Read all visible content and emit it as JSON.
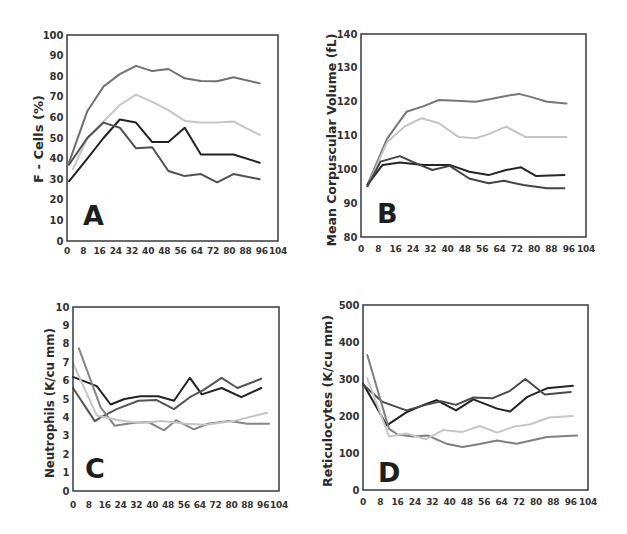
{
  "chart_data": [
    {
      "panel": "A",
      "type": "line",
      "title": "",
      "xlabel": "",
      "ylabel": "F - Cells (%)",
      "xlim": [
        0,
        104
      ],
      "ylim": [
        0,
        100
      ],
      "xticks": [
        0,
        8,
        16,
        24,
        32,
        40,
        48,
        56,
        64,
        72,
        80,
        88,
        96,
        104
      ],
      "yticks": [
        0,
        10,
        20,
        30,
        40,
        50,
        60,
        70,
        80,
        90,
        100
      ],
      "grid": false,
      "legend": null,
      "series": [
        {
          "id": "s1",
          "shade": "medium gray",
          "color": "#707070",
          "x": [
            1,
            10,
            18,
            26,
            34,
            42,
            50,
            58,
            66,
            74,
            82,
            95
          ],
          "y": [
            38,
            63,
            75,
            81,
            85,
            82.5,
            83.5,
            79,
            77.7,
            77.5,
            79.5,
            76.5
          ]
        },
        {
          "id": "s2",
          "shade": "light gray",
          "color": "#c6c6c6",
          "x": [
            3,
            10,
            18,
            26,
            34,
            42,
            50,
            58,
            66,
            74,
            82,
            95
          ],
          "y": [
            35,
            50,
            58,
            66,
            71,
            67.5,
            63.5,
            58.3,
            57.5,
            57.5,
            58,
            51.5
          ]
        },
        {
          "id": "s3",
          "shade": "black",
          "color": "#222222",
          "x": [
            1,
            10,
            18,
            26,
            34,
            42,
            50,
            58,
            66,
            74,
            82,
            95
          ],
          "y": [
            29,
            40,
            50,
            59,
            57.5,
            48,
            48,
            55,
            42,
            42,
            42,
            38
          ]
        },
        {
          "id": "s4",
          "shade": "dark gray",
          "color": "#505050",
          "x": [
            1,
            10,
            18,
            26,
            34,
            42,
            50,
            58,
            66,
            74,
            82,
            95
          ],
          "y": [
            37,
            50,
            57.5,
            55,
            45,
            45.5,
            34,
            31.5,
            32.5,
            28.5,
            32.5,
            30
          ]
        }
      ]
    },
    {
      "panel": "B",
      "type": "line",
      "title": "",
      "xlabel": "",
      "ylabel": "Mean Corpuscular Volume (fL)",
      "xlim": [
        0,
        104
      ],
      "ylim": [
        80,
        140
      ],
      "xticks": [
        0,
        8,
        16,
        24,
        32,
        40,
        48,
        56,
        64,
        72,
        80,
        88,
        96,
        104
      ],
      "yticks": [
        80,
        90,
        100,
        110,
        120,
        130,
        140
      ],
      "grid": false,
      "legend": null,
      "series": [
        {
          "id": "s1",
          "shade": "medium gray",
          "color": "#777777",
          "x": [
            3,
            12,
            21,
            29,
            36,
            44,
            53,
            60,
            67,
            73,
            78,
            86,
            95
          ],
          "y": [
            95.5,
            109,
            117,
            118.7,
            120.5,
            120.3,
            120,
            120.8,
            121.7,
            122.3,
            121.5,
            120,
            119.5
          ]
        },
        {
          "id": "s2",
          "shade": "light gray",
          "color": "#c4c4c4",
          "x": [
            3,
            12,
            20,
            28,
            36,
            45,
            53,
            59,
            67,
            76,
            95
          ],
          "y": [
            95,
            108,
            112.6,
            115.1,
            113.6,
            109.6,
            109.2,
            110.4,
            112.6,
            109.6,
            109.6
          ]
        },
        {
          "id": "s3",
          "shade": "black",
          "color": "#262626",
          "x": [
            3,
            10,
            18,
            29,
            41,
            50,
            59,
            67,
            74,
            81,
            94
          ],
          "y": [
            95.5,
            101.3,
            102,
            101.3,
            101.3,
            99.3,
            98.3,
            99.8,
            100.6,
            98,
            98.3
          ]
        },
        {
          "id": "s4",
          "shade": "dark gray",
          "color": "#444444",
          "x": [
            3,
            9,
            18,
            26,
            33,
            41,
            50,
            59,
            66,
            75,
            86,
            94
          ],
          "y": [
            95,
            102.3,
            103.9,
            101.6,
            99.8,
            101,
            97.3,
            95.9,
            96.6,
            95.4,
            94.4,
            94.4
          ]
        }
      ]
    },
    {
      "panel": "C",
      "type": "line",
      "title": "",
      "xlabel": "",
      "ylabel": "Neutrophils (K/cu mm)",
      "xlim": [
        0,
        104
      ],
      "ylim": [
        0,
        10
      ],
      "xticks": [
        0,
        8,
        16,
        24,
        32,
        40,
        48,
        56,
        64,
        72,
        80,
        88,
        96,
        104
      ],
      "yticks": [
        0,
        1,
        2,
        3,
        4,
        5,
        6,
        7,
        8,
        9,
        10
      ],
      "grid": false,
      "legend": null,
      "series": [
        {
          "id": "s1",
          "shade": "black",
          "color": "#222222",
          "x": [
            0,
            12,
            19,
            26,
            34,
            43,
            51,
            59,
            65,
            75,
            85,
            95
          ],
          "y": [
            6.2,
            5.7,
            4.7,
            5.0,
            5.15,
            5.15,
            4.9,
            6.15,
            5.25,
            5.6,
            5.1,
            5.6
          ]
        },
        {
          "id": "s2",
          "shade": "dark gray",
          "color": "#555555",
          "x": [
            0,
            11,
            14,
            22,
            33,
            42,
            51,
            59,
            66,
            75,
            83,
            95
          ],
          "y": [
            5.6,
            3.8,
            4.0,
            4.45,
            4.9,
            4.95,
            4.45,
            5.1,
            5.5,
            6.15,
            5.6,
            6.1
          ]
        },
        {
          "id": "s3",
          "shade": "medium gray",
          "color": "#858585",
          "x": [
            3,
            14,
            21,
            30,
            38,
            46,
            52,
            61,
            68,
            79,
            88,
            99
          ],
          "y": [
            7.75,
            4.55,
            3.55,
            3.7,
            3.75,
            3.3,
            3.85,
            3.35,
            3.65,
            3.8,
            3.65,
            3.65
          ]
        },
        {
          "id": "s4",
          "shade": "light gray",
          "color": "#c4c4c4",
          "x": [
            0,
            12,
            23,
            34,
            45,
            57,
            67,
            81,
            98
          ],
          "y": [
            6.95,
            4.1,
            3.85,
            3.7,
            3.8,
            3.65,
            3.6,
            3.8,
            4.25
          ]
        }
      ]
    },
    {
      "panel": "D",
      "type": "line",
      "title": "",
      "xlabel": "",
      "ylabel": "Reticulocytes (K/cu mm)",
      "xlim": [
        0,
        104
      ],
      "ylim": [
        0,
        500
      ],
      "xticks": [
        0,
        8,
        16,
        24,
        32,
        40,
        48,
        56,
        64,
        72,
        80,
        88,
        96,
        104
      ],
      "yticks": [
        0,
        100,
        200,
        300,
        400,
        500
      ],
      "grid": false,
      "legend": null,
      "series": [
        {
          "id": "s1",
          "shade": "black",
          "color": "#222222",
          "x": [
            0,
            11,
            20,
            28,
            34,
            43,
            51,
            62,
            68,
            76,
            85,
            97
          ],
          "y": [
            288,
            175,
            210,
            230,
            243,
            215,
            245,
            220,
            212,
            252,
            275,
            282
          ]
        },
        {
          "id": "s2",
          "shade": "dark gray",
          "color": "#4a4a4a",
          "x": [
            0,
            9,
            20,
            29,
            36,
            43,
            51,
            60,
            68,
            75,
            84,
            96
          ],
          "y": [
            285,
            238,
            215,
            230,
            240,
            230,
            250,
            248,
            268,
            300,
            258,
            265
          ]
        },
        {
          "id": "s3",
          "shade": "medium gray",
          "color": "#808080",
          "x": [
            2,
            12,
            16,
            23,
            30,
            39,
            46,
            54,
            62,
            71,
            85,
            99
          ],
          "y": [
            365,
            165,
            150,
            145,
            147,
            124,
            116,
            124,
            134,
            125,
            143,
            147
          ]
        },
        {
          "id": "s4",
          "shade": "light gray",
          "color": "#c6c6c6",
          "x": [
            2,
            12,
            20,
            29,
            37,
            46,
            54,
            62,
            70,
            77,
            86,
            97
          ],
          "y": [
            302,
            145,
            153,
            137,
            162,
            157,
            173,
            155,
            172,
            177,
            196,
            200
          ]
        }
      ]
    }
  ]
}
